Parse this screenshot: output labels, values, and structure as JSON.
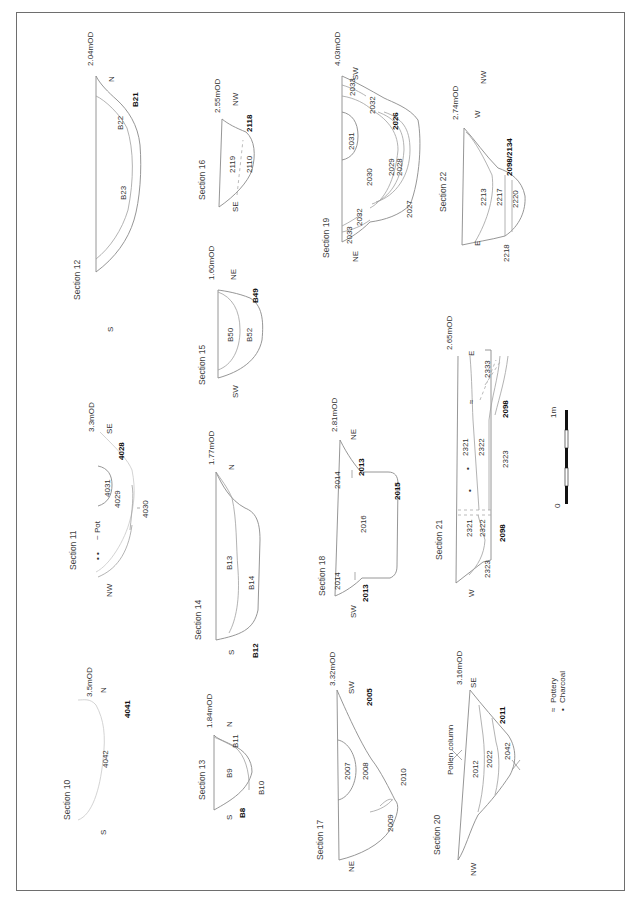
{
  "figure": {
    "orientation": "rotated 90 degrees counter-clockwise",
    "legend": {
      "items": [
        {
          "symbol": "pottery-icon",
          "label": "Pottery"
        },
        {
          "symbol": "charcoal-icon",
          "label": "Charcoal"
        }
      ]
    },
    "scale_bar": {
      "start_label": "0",
      "end_label": "1m"
    }
  },
  "sections": [
    {
      "id": "s10",
      "title": "Section 10",
      "datum": "3.5mOD",
      "left": "S",
      "right": "N",
      "contexts": [
        "4042"
      ],
      "cut": "4041"
    },
    {
      "id": "s11",
      "title": "Section 11",
      "datum": "3.3mOD",
      "left": "NW",
      "right": "SE",
      "contexts": [
        "4031",
        "4029",
        "4030"
      ],
      "cut": "4028",
      "find": "Pot"
    },
    {
      "id": "s12",
      "title": "Section 12",
      "datum": "2.04mOD",
      "left": "S",
      "right": "N",
      "contexts": [
        "B23",
        "B22"
      ],
      "cut": "B21"
    },
    {
      "id": "s13",
      "title": "Section 13",
      "datum": "1.84mOD",
      "left": "S",
      "right": "N",
      "contexts": [
        "B9",
        "B10",
        "B11"
      ],
      "cut": "B8"
    },
    {
      "id": "s14",
      "title": "Section 14",
      "datum": "1.77mOD",
      "left": "S",
      "right": "N",
      "contexts": [
        "B13",
        "B14"
      ],
      "cut": "B12"
    },
    {
      "id": "s15",
      "title": "Section 15",
      "datum": "1.60mOD",
      "left": "SW",
      "right": "NE",
      "contexts": [
        "B50",
        "B52"
      ],
      "cut": "B49"
    },
    {
      "id": "s16",
      "title": "Section 16",
      "datum": "2.55mOD",
      "left": "SE",
      "right": "NW",
      "contexts": [
        "2119",
        "2110"
      ],
      "cut": "2118"
    },
    {
      "id": "s17",
      "title": "Section 17",
      "datum": "3.32mOD",
      "left": "NE",
      "right": "SW",
      "contexts": [
        "2007",
        "2008",
        "2009",
        "2010"
      ],
      "cut": "2005"
    },
    {
      "id": "s18",
      "title": "Section 18",
      "datum": "2.81mOD",
      "left": "SW",
      "right": "NE",
      "contexts": [
        "2014",
        "2016",
        "2014"
      ],
      "cut_left": "2013",
      "cut_right": "2013",
      "cut": "2015"
    },
    {
      "id": "s19",
      "title": "Section 19",
      "datum": "4.03mOD",
      "left": "NE",
      "right": "SW",
      "contexts": [
        "2033",
        "2032",
        "2031",
        "2030",
        "2029",
        "2028",
        "2027",
        "2032",
        "2033"
      ],
      "cut": "2026"
    },
    {
      "id": "s20",
      "title": "Section 20",
      "datum": "3.16mOD",
      "left": "NW",
      "right": "SE",
      "contexts": [
        "2012",
        "2022",
        "2042"
      ],
      "cut": "2011",
      "annotation": "Pollen column"
    },
    {
      "id": "s21",
      "title": "Section 21",
      "datum": "2.65mOD",
      "left": "W",
      "right": "E",
      "contexts": [
        "2321",
        "2322",
        "2323",
        "2321",
        "2322",
        "2323",
        "2333"
      ],
      "cut": "2098"
    },
    {
      "id": "s22",
      "title": "Section 22",
      "datum": "2.74mOD",
      "left": "E",
      "right": "W",
      "extra_dir": "NW",
      "contexts": [
        "2213",
        "2217",
        "2220",
        "2218"
      ],
      "cut": "2098/2134"
    }
  ]
}
